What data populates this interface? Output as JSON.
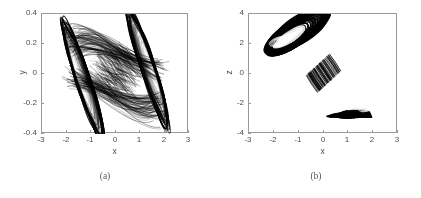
{
  "figure": {
    "background_color": "#ffffff",
    "axis_color": "#9a9a9a",
    "text_color": "#4d4d4d",
    "trace_color": "#000000",
    "caption_color": "#5a5a5a"
  },
  "panels": [
    {
      "id": "a",
      "caption": "(a)",
      "xlabel": "x",
      "ylabel": "y",
      "xticks": [
        "-3",
        "-2",
        "-1",
        "0",
        "1",
        "2",
        "3"
      ],
      "xtick_values": [
        -3,
        -2,
        -1,
        0,
        1,
        2,
        3
      ],
      "yticks": [
        "-0.4",
        "-0.2",
        "0",
        "0.2",
        "0.4"
      ],
      "ytick_values": [
        -0.4,
        -0.2,
        0,
        0.2,
        0.4
      ],
      "xlim": [
        -3,
        3
      ],
      "ylim": [
        -0.4,
        0.4
      ]
    },
    {
      "id": "b",
      "caption": "(b)",
      "xlabel": "x",
      "ylabel": "z",
      "xticks": [
        "-3",
        "-2",
        "-1",
        "0",
        "1",
        "2",
        "3"
      ],
      "xtick_values": [
        -3,
        -2,
        -1,
        0,
        1,
        2,
        3
      ],
      "yticks": [
        "-4",
        "-2",
        "0",
        "2",
        "4"
      ],
      "ytick_values": [
        -4,
        -2,
        0,
        2,
        4
      ],
      "xlim": [
        -3,
        3
      ],
      "ylim": [
        -4,
        4
      ]
    }
  ],
  "chart_data": [
    {
      "type": "line",
      "title": "",
      "xlabel": "x",
      "ylabel": "y",
      "xlim": [
        -3,
        3
      ],
      "ylim": [
        -0.4,
        0.4
      ],
      "grid": false,
      "legend": "none",
      "description": "Double-scroll chaotic attractor projected onto the x-y plane. Two mirror-symmetric spiral lobes centred near x=-1.55 and x=+1.55 with y near 0, joined by a dense saddle band crossing the origin. Outer trajectory envelope spans x in [-2.25, 2.25] and y in [-0.36, 0.36]. Each lobe contains a lighter elliptical hole at its core.",
      "series": [
        {
          "name": "attractor-xy",
          "generator": "double_scroll_projection",
          "lobe_centers": [
            [
              -1.55,
              -0.02
            ],
            [
              1.55,
              0.02
            ]
          ],
          "lobe_rx": 0.72,
          "lobe_ry": 0.165,
          "lobe_tilt_deg": -28,
          "lobe_tilt_deg_right": -28,
          "hole_scale": 0.3,
          "bands": 46,
          "saddle_center": [
            0.0,
            0.02
          ],
          "envelope_x": [
            -2.25,
            2.25
          ],
          "envelope_y": [
            -0.36,
            0.36
          ]
        }
      ]
    },
    {
      "type": "line",
      "title": "",
      "xlabel": "x",
      "ylabel": "z",
      "xlim": [
        -3,
        3
      ],
      "ylim": [
        -4,
        4
      ],
      "grid": false,
      "legend": "none",
      "description": "Same attractor projected onto the x-z plane, appearing as a thin flattened ribbon forming a stretched figure-eight / S shape running from upper-left to lower-right. Upper-left lobe centred near x=-1.75, z=2.1 and lower-right lobe centred near x=1.75, z=-2.1, each with a narrow elongated hole. A striped dense crossing region sits near the origin.",
      "series": [
        {
          "name": "attractor-xz",
          "generator": "ribbon_figure_eight",
          "lobe_centers": [
            [
              -1.72,
              2.05
            ],
            [
              1.72,
              -2.05
            ]
          ],
          "lobe_rx": 0.62,
          "lobe_ry": 0.95,
          "lobe_tilt_deg": -52,
          "ribbon_half_width": 0.42,
          "bands": 40,
          "crossing_center": [
            0.0,
            0.05
          ],
          "envelope_x": [
            -2.2,
            2.2
          ],
          "envelope_z": [
            -3.1,
            3.1
          ]
        }
      ]
    }
  ]
}
